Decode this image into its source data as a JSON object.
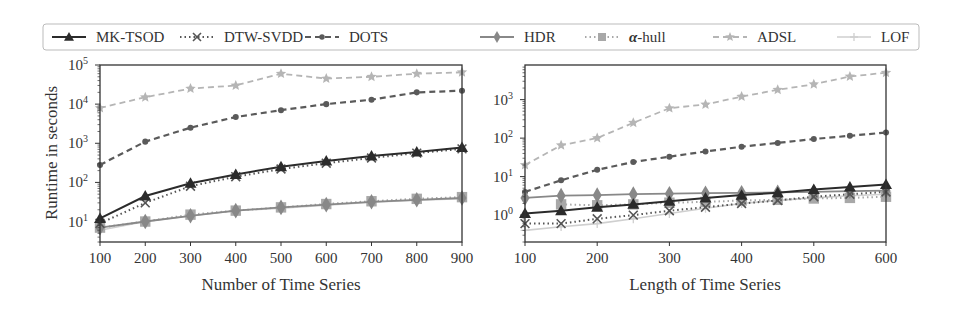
{
  "legend": [
    {
      "name": "MK-TSOD",
      "color": "#2b2b2b",
      "dash": "solid",
      "marker": "triangle"
    },
    {
      "name": "DTW-SVDD",
      "color": "#555555",
      "dash": "dotted",
      "marker": "x"
    },
    {
      "name": "DOTS",
      "color": "#5a5a5a",
      "dash": "dashed",
      "marker": "circle"
    },
    {
      "name": "HDR",
      "color": "#888888",
      "dash": "solid",
      "marker": "diamond"
    },
    {
      "name": "α-hull",
      "color": "#a8a8a8",
      "dash": "dotted",
      "marker": "square"
    },
    {
      "name": "ADSL",
      "color": "#b5b5b5",
      "dash": "dashed",
      "marker": "star"
    },
    {
      "name": "LOF",
      "color": "#cfcfcf",
      "dash": "solid",
      "marker": "plus"
    }
  ],
  "chart_data": [
    {
      "type": "line",
      "title": "",
      "xlabel": "Number of Time Series",
      "ylabel": "Runtime in seconds",
      "yscale": "log",
      "xlim": [
        100,
        900
      ],
      "ylim": [
        3,
        100000
      ],
      "grid": false,
      "legend_position": "top (shared, above both plots)",
      "x_ticks": [
        "100",
        "200",
        "300",
        "400",
        "500",
        "600",
        "700",
        "800",
        "900"
      ],
      "y_ticks": [
        {
          "base": "10",
          "exp": "1"
        },
        {
          "base": "10",
          "exp": "2"
        },
        {
          "base": "10",
          "exp": "3"
        },
        {
          "base": "10",
          "exp": "4"
        },
        {
          "base": "10",
          "exp": "5"
        }
      ],
      "x": [
        100,
        200,
        300,
        400,
        500,
        600,
        700,
        800,
        900
      ],
      "series": [
        {
          "name": "ADSL",
          "values": [
            8000,
            15000,
            25000,
            30000,
            60000,
            45000,
            50000,
            60000,
            65000
          ]
        },
        {
          "name": "DOTS",
          "values": [
            280,
            1100,
            2500,
            4700,
            7000,
            10000,
            13000,
            20000,
            22000
          ]
        },
        {
          "name": "LOF",
          "values": [
            6,
            10,
            14,
            19,
            22,
            26,
            31,
            35,
            38
          ]
        },
        {
          "name": "α-hull",
          "values": [
            7,
            10,
            15,
            19,
            23,
            28,
            33,
            38,
            42
          ]
        },
        {
          "name": "HDR",
          "values": [
            7,
            10,
            14,
            19,
            23,
            27,
            32,
            36,
            40
          ]
        },
        {
          "name": "DTW-SVDD",
          "values": [
            9,
            30,
            80,
            140,
            220,
            310,
            420,
            560,
            720
          ]
        },
        {
          "name": "MK-TSOD",
          "values": [
            12,
            45,
            95,
            160,
            250,
            350,
            470,
            600,
            780
          ]
        }
      ]
    },
    {
      "type": "line",
      "title": "",
      "xlabel": "Length of Time Series",
      "ylabel": "",
      "yscale": "log",
      "xlim": [
        100,
        600
      ],
      "ylim": [
        0.2,
        8000
      ],
      "grid": false,
      "x_ticks": [
        "100",
        "200",
        "300",
        "400",
        "500",
        "600"
      ],
      "y_ticks": [
        {
          "base": "10",
          "exp": "0"
        },
        {
          "base": "10",
          "exp": "1"
        },
        {
          "base": "10",
          "exp": "2"
        },
        {
          "base": "10",
          "exp": "3"
        }
      ],
      "x": [
        100,
        150,
        200,
        250,
        300,
        350,
        400,
        450,
        500,
        550,
        600
      ],
      "series": [
        {
          "name": "ADSL",
          "values": [
            20,
            65,
            100,
            250,
            600,
            750,
            1200,
            1800,
            2500,
            4000,
            5000
          ]
        },
        {
          "name": "DOTS",
          "values": [
            4,
            8,
            15,
            24,
            33,
            45,
            60,
            75,
            95,
            115,
            140
          ]
        },
        {
          "name": "LOF",
          "values": [
            0.4,
            0.5,
            0.6,
            0.8,
            1.1,
            1.5,
            2.0,
            2.4,
            2.8,
            3.2,
            3.5
          ]
        },
        {
          "name": "α-hull",
          "values": [
            null,
            1.9,
            1.8,
            1.9,
            2.1,
            2.2,
            2.4,
            2.5,
            2.7,
            2.8,
            3.0
          ]
        },
        {
          "name": "HDR",
          "values": [
            2.8,
            3.2,
            3.3,
            3.5,
            3.6,
            3.7,
            3.8,
            3.9,
            4.0,
            4.2,
            4.3
          ]
        },
        {
          "name": "DTW-SVDD",
          "values": [
            0.6,
            0.6,
            0.8,
            1.0,
            1.3,
            1.6,
            2.0,
            2.4,
            3.0,
            3.5,
            4.0
          ]
        },
        {
          "name": "MK-TSOD",
          "values": [
            1.1,
            1.3,
            1.6,
            1.9,
            2.3,
            2.8,
            3.3,
            3.8,
            4.6,
            5.4,
            6.2
          ]
        }
      ]
    }
  ]
}
